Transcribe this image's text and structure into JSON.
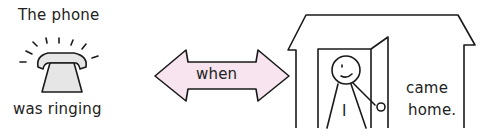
{
  "diagram": {
    "left_panel": {
      "top_text": "The phone",
      "bottom_text": "was ringing",
      "icon": "ringing-telephone-icon"
    },
    "connector": {
      "label": "when",
      "shape": "double-headed-arrow",
      "fill_color": "#f7e4ef"
    },
    "right_panel": {
      "icon": "house-with-person-in-doorway",
      "person_label": "I",
      "text_line1": "came",
      "text_line2": "home."
    },
    "colors": {
      "line": "#1a1a1a",
      "phone_fill": "#e6e6e6",
      "arrow_fill": "#f7e4ef"
    }
  }
}
